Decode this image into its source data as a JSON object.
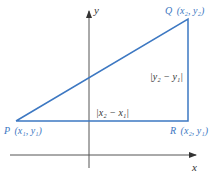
{
  "diagram": {
    "axes": {
      "x_label": "x",
      "y_label": "y",
      "color": "#555555"
    },
    "triangle": {
      "stroke_color": "#3d78c2",
      "label_color": "#3d78c2"
    },
    "points": {
      "P": {
        "name": "P",
        "coords": "(x₁, y₁)"
      },
      "Q": {
        "name": "Q",
        "coords": "(x₂, y₂)"
      },
      "R": {
        "name": "R",
        "coords": "(x₂, y₁)"
      }
    },
    "distances": {
      "horizontal": "|x₂ − x₁|",
      "vertical": "|y₂ − y₁|"
    }
  }
}
